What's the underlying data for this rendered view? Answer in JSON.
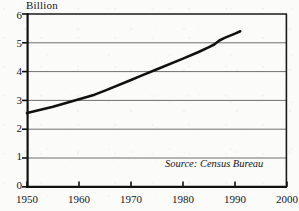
{
  "chart_data": {
    "type": "line",
    "title": "",
    "subtitle": "",
    "ylabel": "Billion",
    "xlabel": "",
    "xlim": [
      1950,
      2000
    ],
    "ylim": [
      0,
      6
    ],
    "grid": true,
    "grid_axis": "y",
    "legend": false,
    "legend_position": "none",
    "annotations": [
      {
        "name": "source-note",
        "text": "Source: Census Bureau",
        "x": 1972,
        "y": 0.85,
        "style": "italic"
      }
    ],
    "y_ticks": [
      "6",
      "5",
      "4",
      "3",
      "2",
      "1",
      "0"
    ],
    "y_tick_values": [
      6,
      5,
      4,
      3,
      2,
      1,
      0
    ],
    "x_ticks": [
      "1950",
      "1960",
      "1970",
      "1980",
      "1990",
      "2000"
    ],
    "x_tick_values": [
      1950,
      1960,
      1970,
      1980,
      1990,
      2000
    ],
    "series": [
      {
        "name": "World population",
        "color": "#111111",
        "line_width": 2.6,
        "x": [
          1950,
          1955,
          1960,
          1963,
          1965,
          1970,
          1972,
          1975,
          1980,
          1983,
          1985,
          1986,
          1987,
          1988,
          1990,
          1991
        ],
        "values": [
          2.56,
          2.78,
          3.04,
          3.2,
          3.34,
          3.71,
          3.86,
          4.08,
          4.45,
          4.68,
          4.85,
          4.94,
          5.08,
          5.17,
          5.32,
          5.4
        ]
      }
    ]
  },
  "axis_label": {
    "text": "Billion"
  },
  "colors": {
    "line": "#111111",
    "frame": "#1a1a1a",
    "grid": "#6e6e6e",
    "text": "#16161a",
    "background": "#fbfbfa"
  }
}
